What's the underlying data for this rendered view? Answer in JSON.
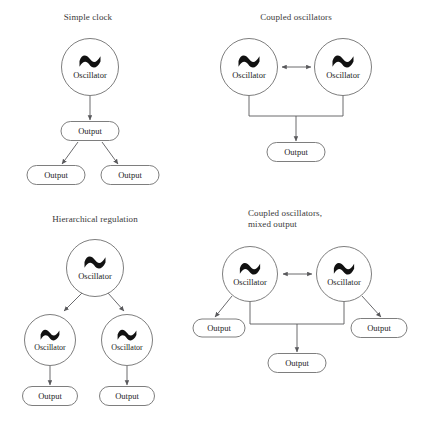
{
  "figure": {
    "background_color": "#ffffff",
    "stroke_color": "#6f6f6f",
    "connector_color": "#59595c",
    "text_color": "#222222",
    "title_color": "#3a3a3a",
    "glyph_color": "#111111",
    "oscillator_label": "Oscillator",
    "output_label": "Output",
    "oscillator_glyph": "tilde"
  },
  "panels": [
    {
      "id": "simple-clock",
      "title_lines": [
        "Simple clock"
      ],
      "title_x": 88,
      "title_y": 20,
      "oscillators": [
        {
          "name": "root",
          "cx": 90,
          "cy": 67,
          "r": 28.5,
          "label": "Oscillator"
        }
      ],
      "outputs": [
        {
          "name": "primary",
          "cx": 90,
          "cy": 131,
          "w": 58,
          "h": 19,
          "label": "Output"
        },
        {
          "name": "left",
          "cx": 56,
          "cy": 175,
          "w": 58,
          "h": 19,
          "label": "Output"
        },
        {
          "name": "right",
          "cx": 130,
          "cy": 175,
          "w": 58,
          "h": 19,
          "label": "Output"
        }
      ],
      "connectors": [
        {
          "name": "root-to-primary",
          "type": "arrow",
          "x1": 90,
          "y1": 96,
          "x2": 90,
          "y2": 120
        },
        {
          "name": "primary-to-left",
          "type": "arrow",
          "x1": 78,
          "y1": 142,
          "x2": 62,
          "y2": 164
        },
        {
          "name": "primary-to-right",
          "type": "arrow",
          "x1": 102,
          "y1": 142,
          "x2": 118,
          "y2": 164
        }
      ],
      "buses": []
    },
    {
      "id": "coupled-oscillators",
      "title_lines": [
        "Coupled oscillators"
      ],
      "title_x": 296,
      "title_y": 20,
      "oscillators": [
        {
          "name": "left",
          "cx": 249,
          "cy": 67,
          "r": 28.5,
          "label": "Oscillator"
        },
        {
          "name": "right",
          "cx": 343,
          "cy": 67,
          "r": 28.5,
          "label": "Oscillator"
        }
      ],
      "outputs": [
        {
          "name": "primary",
          "cx": 296,
          "cy": 152,
          "w": 58,
          "h": 19,
          "label": "Output"
        }
      ],
      "connectors": [
        {
          "name": "coupling",
          "type": "doublearrow",
          "x1": 282,
          "y1": 67,
          "x2": 311,
          "y2": 67
        },
        {
          "name": "bus-to-primary",
          "type": "arrow",
          "x1": 296,
          "y1": 116,
          "x2": 296,
          "y2": 141
        }
      ],
      "buses": [
        {
          "name": "merge-bus",
          "left_x": 249,
          "right_x": 343,
          "top_y": 95,
          "bar_y": 116
        }
      ]
    },
    {
      "id": "hierarchical-regulation",
      "title_lines": [
        "Hierarchical regulation"
      ],
      "title_x": 95,
      "title_y": 222,
      "oscillators": [
        {
          "name": "root",
          "cx": 95,
          "cy": 268,
          "r": 28.5,
          "label": "Oscillator"
        },
        {
          "name": "child-left",
          "cx": 50,
          "cy": 340,
          "r": 25.5,
          "label": "Oscillator"
        },
        {
          "name": "child-right",
          "cx": 127,
          "cy": 340,
          "r": 25.5,
          "label": "Oscillator"
        }
      ],
      "outputs": [
        {
          "name": "left",
          "cx": 50,
          "cy": 396,
          "w": 55,
          "h": 19,
          "label": "Output"
        },
        {
          "name": "right",
          "cx": 127,
          "cy": 396,
          "w": 55,
          "h": 19,
          "label": "Output"
        }
      ],
      "connectors": [
        {
          "name": "root-to-child-left",
          "type": "arrow",
          "x1": 82,
          "y1": 293,
          "x2": 64,
          "y2": 311
        },
        {
          "name": "root-to-child-right",
          "type": "arrow",
          "x1": 108,
          "y1": 293,
          "x2": 124,
          "y2": 311
        },
        {
          "name": "child-left-to-output",
          "type": "arrow",
          "x1": 50,
          "y1": 366,
          "x2": 50,
          "y2": 385
        },
        {
          "name": "child-right-to-output",
          "type": "arrow",
          "x1": 127,
          "y1": 366,
          "x2": 127,
          "y2": 385
        }
      ],
      "buses": []
    },
    {
      "id": "coupled-oscillators-mixed-output",
      "title_lines": [
        "Coupled oscillators,",
        "mixed output"
      ],
      "title_x": 248,
      "title_y": 216,
      "title_align": "start",
      "oscillators": [
        {
          "name": "left",
          "cx": 250,
          "cy": 274,
          "r": 27.5,
          "label": "Oscillator"
        },
        {
          "name": "right",
          "cx": 344,
          "cy": 274,
          "r": 27.5,
          "label": "Oscillator"
        }
      ],
      "outputs": [
        {
          "name": "left-side",
          "cx": 219,
          "cy": 328,
          "w": 52,
          "h": 18,
          "label": "Output"
        },
        {
          "name": "center",
          "cx": 297,
          "cy": 363,
          "w": 58,
          "h": 19,
          "label": "Output"
        },
        {
          "name": "right-side",
          "cx": 379,
          "cy": 328,
          "w": 56,
          "h": 19,
          "label": "Output"
        }
      ],
      "connectors": [
        {
          "name": "coupling",
          "type": "doublearrow",
          "x1": 283,
          "y1": 274,
          "x2": 312,
          "y2": 274
        },
        {
          "name": "left-to-left-output",
          "type": "arrow",
          "x1": 232,
          "y1": 296,
          "x2": 215,
          "y2": 317
        },
        {
          "name": "right-to-right-output",
          "type": "arrow",
          "x1": 362,
          "y1": 296,
          "x2": 381,
          "y2": 317
        },
        {
          "name": "bus-to-center",
          "type": "arrow",
          "x1": 297,
          "y1": 324,
          "x2": 297,
          "y2": 352
        }
      ],
      "buses": [
        {
          "name": "merge-bus",
          "left_x": 250,
          "right_x": 344,
          "top_y": 301,
          "bar_y": 324
        }
      ]
    }
  ]
}
